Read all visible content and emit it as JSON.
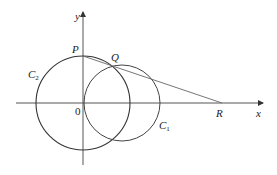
{
  "diagram": {
    "axes": {
      "x_label": "x",
      "y_label": "y",
      "origin_label": "0"
    },
    "points": {
      "P": {
        "label": "P"
      },
      "Q": {
        "label": "Q"
      },
      "R": {
        "label": "R"
      }
    },
    "circles": {
      "C1": {
        "label": "C",
        "subscript": "1"
      },
      "C2": {
        "label": "C",
        "subscript": "2"
      }
    },
    "colors": {
      "stroke": "#333333",
      "axis": "#555555",
      "line": "#666666"
    }
  }
}
